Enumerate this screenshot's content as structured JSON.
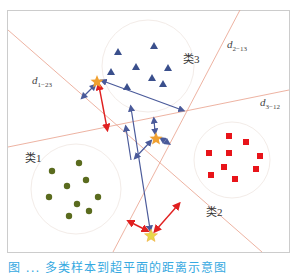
{
  "diagram": {
    "clusters": [
      {
        "label": "类1",
        "shape": "circle",
        "color": "#5a6b1e"
      },
      {
        "label": "类2",
        "shape": "square",
        "color": "#e8141a"
      },
      {
        "label": "类3",
        "shape": "triangle",
        "color": "#3a4f8c"
      }
    ],
    "boundaries": [
      {
        "label_main": "d",
        "label_sub": "1−23"
      },
      {
        "label_main": "d",
        "label_sub": "2−13"
      },
      {
        "label_main": "d",
        "label_sub": "3−12"
      }
    ],
    "colors": {
      "boundary_line": "#e8a08a",
      "blue_arrow": "#4a5a9a",
      "red_arrow": "#e02020",
      "star": "#f0a030",
      "frame": "#cccccc"
    },
    "caption": "图 ... 多类样本到超平面的距离示意图"
  }
}
